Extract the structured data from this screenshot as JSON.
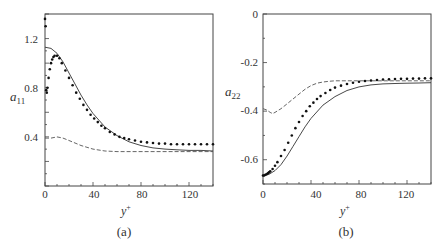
{
  "chart_data": [
    {
      "type": "line",
      "panel_label": "(a)",
      "xlabel": "y+",
      "ylabel": "a11",
      "xlim": [
        0,
        140
      ],
      "ylim": [
        0,
        1.4
      ],
      "xticks": [
        0,
        40,
        80,
        120
      ],
      "yticks": [
        0.4,
        0.8,
        1.2
      ],
      "grid": false,
      "legend": null,
      "series": [
        {
          "name": "solid",
          "style": "solid",
          "x": [
            0,
            5,
            10,
            15,
            20,
            25,
            30,
            35,
            40,
            50,
            60,
            70,
            80,
            90,
            100,
            110,
            120,
            130,
            140
          ],
          "y": [
            1.13,
            1.12,
            1.08,
            1.01,
            0.92,
            0.83,
            0.74,
            0.66,
            0.59,
            0.48,
            0.41,
            0.36,
            0.33,
            0.31,
            0.3,
            0.295,
            0.29,
            0.29,
            0.285
          ]
        },
        {
          "name": "dots",
          "style": "dotted",
          "x": [
            0,
            0.5,
            1,
            1.5,
            2,
            3,
            4,
            5,
            6,
            7,
            8,
            10,
            12,
            14,
            17,
            20,
            23,
            26,
            29,
            32,
            35,
            38,
            41,
            44,
            47,
            50,
            54,
            58,
            62,
            66,
            70,
            75,
            80,
            85,
            90,
            95,
            100,
            105,
            110,
            115,
            120,
            125,
            130,
            135,
            140
          ],
          "y": [
            1.36,
            1.3,
            0.78,
            0.76,
            0.8,
            0.88,
            0.95,
            1.0,
            1.03,
            1.05,
            1.06,
            1.06,
            1.04,
            1.0,
            0.94,
            0.88,
            0.82,
            0.76,
            0.71,
            0.66,
            0.62,
            0.58,
            0.55,
            0.52,
            0.49,
            0.47,
            0.44,
            0.42,
            0.4,
            0.39,
            0.38,
            0.37,
            0.36,
            0.355,
            0.35,
            0.345,
            0.345,
            0.34,
            0.34,
            0.34,
            0.34,
            0.34,
            0.34,
            0.34,
            0.34
          ]
        },
        {
          "name": "dashed",
          "style": "dashed",
          "x": [
            0,
            5,
            10,
            15,
            20,
            30,
            40,
            50,
            60,
            80,
            100,
            120,
            140
          ],
          "y": [
            0.39,
            0.39,
            0.4,
            0.39,
            0.37,
            0.33,
            0.3,
            0.285,
            0.28,
            0.28,
            0.28,
            0.28,
            0.28
          ]
        }
      ]
    },
    {
      "type": "line",
      "panel_label": "(b)",
      "xlabel": "y+",
      "ylabel": "a22",
      "xlim": [
        0,
        140
      ],
      "ylim": [
        -0.7,
        0
      ],
      "xticks": [
        0,
        40,
        80,
        120
      ],
      "yticks": [
        0,
        -0.2,
        -0.4,
        -0.6
      ],
      "grid": false,
      "legend": null,
      "series": [
        {
          "name": "solid",
          "style": "solid",
          "x": [
            0,
            5,
            10,
            15,
            20,
            25,
            30,
            35,
            40,
            50,
            60,
            70,
            80,
            90,
            100,
            110,
            120,
            130,
            140
          ],
          "y": [
            -0.665,
            -0.66,
            -0.645,
            -0.62,
            -0.585,
            -0.545,
            -0.505,
            -0.465,
            -0.43,
            -0.375,
            -0.34,
            -0.315,
            -0.3,
            -0.292,
            -0.288,
            -0.286,
            -0.285,
            -0.284,
            -0.283
          ]
        },
        {
          "name": "dots",
          "style": "dotted",
          "x": [
            0,
            1,
            2,
            3,
            4,
            5,
            6,
            8,
            10,
            12,
            15,
            18,
            21,
            24,
            27,
            30,
            33,
            36,
            39,
            42,
            45,
            48,
            52,
            56,
            60,
            65,
            70,
            75,
            80,
            85,
            90,
            95,
            100,
            105,
            110,
            115,
            120,
            125,
            130,
            135,
            140
          ],
          "y": [
            -0.665,
            -0.665,
            -0.662,
            -0.66,
            -0.656,
            -0.652,
            -0.648,
            -0.638,
            -0.625,
            -0.61,
            -0.585,
            -0.56,
            -0.53,
            -0.5,
            -0.47,
            -0.445,
            -0.42,
            -0.4,
            -0.38,
            -0.365,
            -0.35,
            -0.338,
            -0.325,
            -0.313,
            -0.303,
            -0.295,
            -0.288,
            -0.283,
            -0.279,
            -0.276,
            -0.274,
            -0.272,
            -0.27,
            -0.269,
            -0.268,
            -0.267,
            -0.267,
            -0.266,
            -0.266,
            -0.265,
            -0.265
          ]
        },
        {
          "name": "dashed",
          "style": "dashed",
          "x": [
            0,
            3,
            6,
            8,
            10,
            15,
            20,
            25,
            30,
            35,
            40,
            45,
            50,
            55,
            60,
            80,
            100,
            120,
            140
          ],
          "y": [
            -0.39,
            -0.395,
            -0.405,
            -0.41,
            -0.405,
            -0.39,
            -0.37,
            -0.35,
            -0.33,
            -0.31,
            -0.295,
            -0.285,
            -0.28,
            -0.277,
            -0.275,
            -0.275,
            -0.275,
            -0.275,
            -0.275
          ]
        }
      ]
    }
  ],
  "panels": {
    "a": {
      "label": "(a)",
      "ylabel_main": "a",
      "ylabel_sub": "11",
      "xlabel_main": "y",
      "xlabel_sup": "+",
      "xtick_labels": [
        "0",
        "40",
        "80",
        "120"
      ],
      "ytick_labels": [
        "1.2",
        "0.8",
        "0.4"
      ]
    },
    "b": {
      "label": "(b)",
      "ylabel_main": "a",
      "ylabel_sub": "22",
      "xlabel_main": "y",
      "xlabel_sup": "+",
      "xtick_labels": [
        "0",
        "40",
        "80",
        "120"
      ],
      "ytick_labels": [
        "0",
        "-0.2",
        "-0.4",
        "-0.6"
      ]
    }
  }
}
